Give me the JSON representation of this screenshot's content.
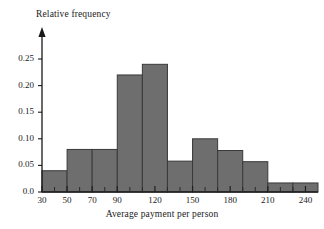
{
  "figure": {
    "kind": "histogram-figure",
    "background_color": "#ffffff"
  },
  "chart_data": {
    "type": "bar",
    "title": "",
    "xlabel": "Average payment per person",
    "ylabel": "Relative frequency",
    "bar_fill_color": "#6e6e6e",
    "bar_edge_color": "#3a3a3a",
    "axis_color": "#1a1a1a",
    "grid": false,
    "legend": null,
    "xlim": [
      30,
      250
    ],
    "ylim": [
      0.0,
      0.27
    ],
    "ytick_values": [
      0.0,
      0.05,
      0.1,
      0.15,
      0.2,
      0.25
    ],
    "ytick_labels": [
      "0.0",
      "0.05",
      "0.10",
      "0.15",
      "0.20",
      "0.25"
    ],
    "xtick_values": [
      30,
      50,
      70,
      90,
      120,
      150,
      180,
      210,
      240
    ],
    "xtick_labels": [
      "30",
      "50",
      "70",
      "90",
      "120",
      "150",
      "180",
      "210",
      "240"
    ],
    "minor_xtick_values": [
      40,
      60,
      80,
      100,
      110,
      130,
      140,
      160,
      170,
      190,
      200,
      220,
      230
    ],
    "bin_edges": [
      30,
      50,
      70,
      90,
      110,
      130,
      150,
      170,
      190,
      210,
      230,
      250
    ],
    "categories": [
      "30-50",
      "50-70",
      "70-90",
      "90-110",
      "110-130",
      "130-150",
      "150-170",
      "170-190",
      "190-210",
      "210-230",
      "230-250"
    ],
    "values": [
      0.04,
      0.08,
      0.08,
      0.22,
      0.24,
      0.058,
      0.1,
      0.078,
      0.057,
      0.017,
      0.017
    ]
  }
}
